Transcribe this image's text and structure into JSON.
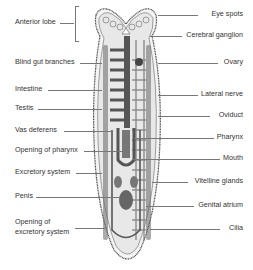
{
  "diagram": {
    "left_labels": [
      {
        "text": "Anterior lobe",
        "y": 22
      },
      {
        "text": "Blind gut branches",
        "y": 62
      },
      {
        "text": "Intestine",
        "y": 89
      },
      {
        "text": "Testis",
        "y": 108
      },
      {
        "text": "Vas deferens",
        "y": 130
      },
      {
        "text": "Opening of pharynx",
        "y": 150
      },
      {
        "text": "Excretory system",
        "y": 172
      },
      {
        "text": "Penis",
        "y": 196
      },
      {
        "text": "Opening of",
        "y": 222
      },
      {
        "text": "excretory system",
        "y": 232
      }
    ],
    "right_labels": [
      {
        "text": "Eye spots",
        "y": 14
      },
      {
        "text": "Cerebral ganglion",
        "y": 35
      },
      {
        "text": "Ovary",
        "y": 62
      },
      {
        "text": "Lateral nerve",
        "y": 94
      },
      {
        "text": "Oviduct",
        "y": 115
      },
      {
        "text": "Pharynx",
        "y": 137
      },
      {
        "text": "Mouth",
        "y": 158
      },
      {
        "text": "Vitelline glands",
        "y": 181
      },
      {
        "text": "Genital atrium",
        "y": 205
      },
      {
        "text": "Cilia",
        "y": 228
      }
    ]
  }
}
